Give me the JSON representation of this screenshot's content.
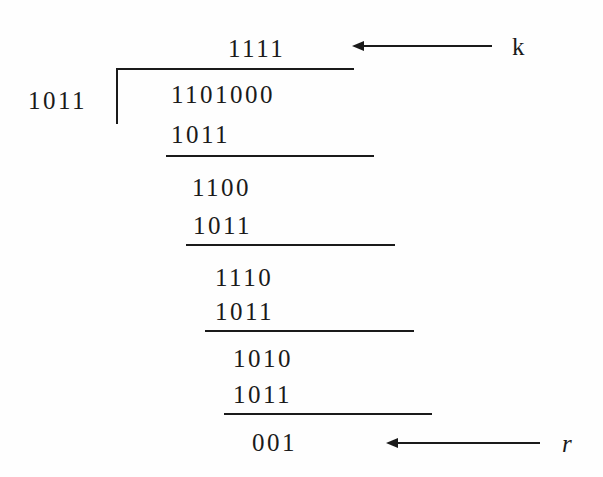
{
  "diagram": {
    "type": "binary-polynomial-long-division",
    "divisor": "1011",
    "dividend": "1101000",
    "quotient": "1111",
    "quotient_label": "k",
    "remainder": "001",
    "remainder_label": "r",
    "steps": [
      {
        "minuend": "1101",
        "subtrahend": "1011",
        "result": "1100"
      },
      {
        "minuend": "1100",
        "subtrahend": "1011",
        "result": "1110"
      },
      {
        "minuend": "1110",
        "subtrahend": "1011",
        "result": "1010"
      },
      {
        "minuend": "1010",
        "subtrahend": "1011",
        "result": "001"
      }
    ],
    "rows": [
      {
        "id": "quotient",
        "text": "1111"
      },
      {
        "id": "divisor",
        "text": "1011"
      },
      {
        "id": "dividend",
        "text": "1101000"
      },
      {
        "id": "sub-1",
        "text": "1011"
      },
      {
        "id": "res-1",
        "text": "1100"
      },
      {
        "id": "sub-2",
        "text": "1011"
      },
      {
        "id": "res-2",
        "text": "1110"
      },
      {
        "id": "sub-3",
        "text": "1011"
      },
      {
        "id": "res-3",
        "text": "1010"
      },
      {
        "id": "sub-4",
        "text": "1011"
      },
      {
        "id": "remainder",
        "text": "001"
      }
    ],
    "colors": {
      "ink": "#1a1a1a",
      "background": "#fefefe"
    }
  }
}
